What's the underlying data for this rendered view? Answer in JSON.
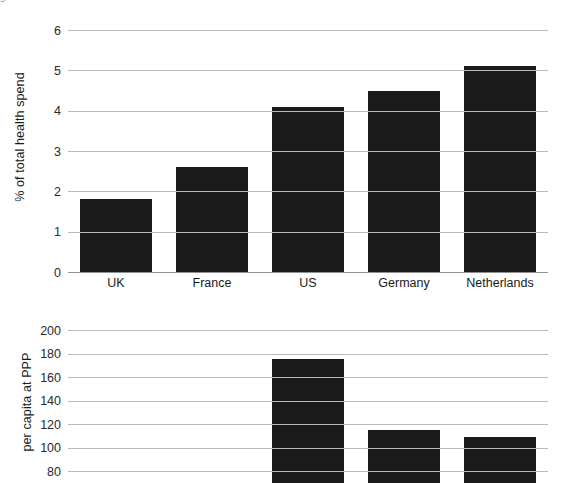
{
  "top_cutoff_text": [
    "g",
    "t",
    "t",
    "t"
  ],
  "chart_data": [
    {
      "type": "bar",
      "id": "health-spend-share",
      "title": "",
      "xlabel": "",
      "ylabel": "% of total health spend",
      "categories": [
        "UK",
        "France",
        "US",
        "Germany",
        "Netherlands"
      ],
      "values": [
        1.8,
        2.6,
        4.1,
        4.5,
        5.1
      ],
      "ylim": [
        0,
        6
      ],
      "yticks": [
        0,
        1,
        2,
        3,
        4,
        5,
        6
      ],
      "ytick_labels": [
        "0",
        "1",
        "2",
        "3",
        "4",
        "5",
        "6"
      ],
      "grid": true,
      "legend": "none",
      "bar_color": "#1a1a1a",
      "grid_color": "#b9b9b9"
    },
    {
      "type": "bar",
      "id": "per-capita-ppp",
      "title": "",
      "xlabel": "",
      "ylabel": "per capita at PPP",
      "categories": [
        "UK",
        "France",
        "US",
        "Germany",
        "Netherlands"
      ],
      "values": [
        null,
        null,
        175,
        115,
        109
      ],
      "ylim": [
        70,
        200
      ],
      "yticks": [
        80,
        100,
        120,
        140,
        160,
        180,
        200
      ],
      "ytick_labels": [
        "80",
        "100",
        "120",
        "140",
        "160",
        "180",
        "200"
      ],
      "grid": true,
      "legend": "none",
      "bar_color": "#1a1a1a",
      "grid_color": "#b9b9b9",
      "note_cropped": "chart continues below image edge"
    }
  ]
}
